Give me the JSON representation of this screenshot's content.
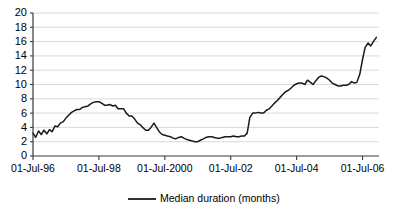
{
  "chart_data": {
    "type": "line",
    "title": "",
    "subtitle": "",
    "xlabel": "",
    "ylabel": "",
    "ylim": [
      0,
      20
    ],
    "ytick_labels": [
      "0",
      "2",
      "4",
      "6",
      "8",
      "10",
      "12",
      "14",
      "16",
      "18",
      "20"
    ],
    "ytick_values": [
      0,
      2,
      4,
      6,
      8,
      10,
      12,
      14,
      16,
      18,
      20
    ],
    "xtick_labels": [
      "01-Jul-96",
      "01-Jul-98",
      "01-Jul-2000",
      "01-Jul-02",
      "01-Jul-04",
      "01-Jul-06"
    ],
    "xtick_values": [
      1996.5,
      1998.5,
      2000.5,
      2002.5,
      2004.5,
      2006.5
    ],
    "xlim": [
      1996.5,
      2007.0
    ],
    "grid": "horizontal",
    "legend_position": "bottom-center",
    "legend": [
      "Median duration (months)"
    ],
    "line_color": "#1a1a1a",
    "grid_color": "#c9c9c9",
    "axis_color": "#3a3a3a",
    "series": [
      {
        "name": "Median duration (months)",
        "x": [
          1996.5,
          1996.58,
          1996.67,
          1996.75,
          1996.83,
          1996.92,
          1997.0,
          1997.08,
          1997.17,
          1997.25,
          1997.33,
          1997.42,
          1997.5,
          1997.58,
          1997.67,
          1997.75,
          1997.83,
          1997.92,
          1998.0,
          1998.08,
          1998.17,
          1998.25,
          1998.33,
          1998.42,
          1998.5,
          1998.58,
          1998.67,
          1998.75,
          1998.83,
          1998.92,
          1999.0,
          1999.08,
          1999.17,
          1999.25,
          1999.33,
          1999.42,
          1999.5,
          1999.58,
          1999.67,
          1999.75,
          1999.83,
          1999.92,
          2000.0,
          2000.08,
          2000.17,
          2000.25,
          2000.33,
          2000.42,
          2000.5,
          2000.58,
          2000.67,
          2000.75,
          2000.83,
          2000.92,
          2001.0,
          2001.08,
          2001.17,
          2001.25,
          2001.33,
          2001.42,
          2001.5,
          2001.58,
          2001.67,
          2001.75,
          2001.83,
          2001.92,
          2002.0,
          2002.08,
          2002.17,
          2002.25,
          2002.33,
          2002.42,
          2002.5,
          2002.58,
          2002.67,
          2002.75,
          2002.83,
          2002.92,
          2003.0,
          2003.08,
          2003.17,
          2003.25,
          2003.33,
          2003.42,
          2003.5,
          2003.58,
          2003.67,
          2003.75,
          2003.83,
          2003.92,
          2004.0,
          2004.08,
          2004.17,
          2004.25,
          2004.33,
          2004.42,
          2004.5,
          2004.58,
          2004.67,
          2004.75,
          2004.83,
          2004.92,
          2005.0,
          2005.08,
          2005.17,
          2005.25,
          2005.33,
          2005.42,
          2005.5,
          2005.58,
          2005.67,
          2005.75,
          2005.83,
          2005.92,
          2006.0,
          2006.08,
          2006.17,
          2006.25,
          2006.33,
          2006.42,
          2006.5,
          2006.58,
          2006.67,
          2006.75,
          2006.83,
          2006.92
        ],
        "values": [
          3.2,
          2.6,
          3.5,
          3.0,
          3.6,
          3.1,
          3.7,
          3.4,
          4.2,
          4.1,
          4.6,
          4.8,
          5.3,
          5.7,
          6.1,
          6.3,
          6.5,
          6.5,
          6.8,
          6.9,
          7.0,
          7.3,
          7.5,
          7.6,
          7.6,
          7.4,
          7.1,
          7.1,
          7.2,
          7.0,
          7.1,
          6.6,
          6.6,
          6.6,
          6.0,
          5.6,
          5.6,
          5.2,
          4.6,
          4.4,
          4.0,
          3.6,
          3.6,
          4.0,
          4.6,
          4.0,
          3.4,
          3.0,
          2.9,
          2.8,
          2.7,
          2.5,
          2.4,
          2.6,
          2.7,
          2.5,
          2.3,
          2.2,
          2.1,
          2.0,
          2.0,
          2.2,
          2.4,
          2.6,
          2.7,
          2.7,
          2.6,
          2.5,
          2.5,
          2.6,
          2.7,
          2.7,
          2.7,
          2.8,
          2.7,
          2.7,
          2.8,
          2.8,
          3.2,
          5.4,
          6.0,
          6.0,
          6.1,
          6.0,
          6.0,
          6.4,
          6.6,
          7.0,
          7.4,
          7.8,
          8.2,
          8.6,
          9.0,
          9.2,
          9.5,
          9.9,
          10.1,
          10.2,
          10.2,
          10.0,
          10.6,
          10.3,
          10.0,
          10.5,
          11.0,
          11.2,
          11.1,
          10.9,
          10.6,
          10.2,
          10.0,
          9.8,
          9.8,
          9.9,
          9.9,
          10.0,
          10.4,
          10.2,
          10.3,
          11.5,
          13.5,
          15.2,
          15.8,
          15.4,
          16.0,
          16.6
        ]
      }
    ]
  },
  "legend": {
    "label": "Median duration (months)"
  },
  "axes": {
    "y_labels": [
      "20",
      "18",
      "16",
      "14",
      "12",
      "10",
      "8",
      "6",
      "4",
      "2",
      "0"
    ],
    "x_labels": [
      "01-Jul-96",
      "01-Jul-98",
      "01-Jul-2000",
      "01-Jul-02",
      "01-Jul-04",
      "01-Jul-06"
    ]
  }
}
